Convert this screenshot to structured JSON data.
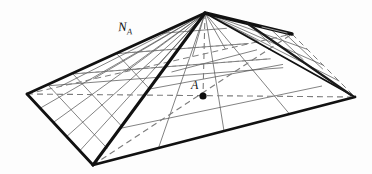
{
  "figure": {
    "kind": "geometric-diagram",
    "background_color": "#fdfdfd",
    "ink_color": "#111111",
    "thin_line_color": "#555555",
    "dashed_line_color": "#7a7a7a"
  },
  "labels": {
    "apex_label": "",
    "face_normal": {
      "base": "N",
      "subscript": "A",
      "text": "N"
    },
    "center_point": {
      "text": "A"
    }
  },
  "geometry": {
    "apex": {
      "x": 205,
      "y": 13
    },
    "base_corners": {
      "left": {
        "x": 27,
        "y": 94
      },
      "front": {
        "x": 93,
        "y": 165
      },
      "right": {
        "x": 355,
        "y": 97
      },
      "back": {
        "x": 292,
        "y": 34
      }
    },
    "center_point_A": {
      "x": 203,
      "y": 96
    },
    "axis": {
      "from": "apex",
      "to": "center_point_A",
      "style": "dashed"
    },
    "diagonals": [
      {
        "from": "left",
        "to": "right",
        "style": "dashed"
      },
      {
        "from": "front",
        "to": "back",
        "style": "dashed"
      }
    ]
  },
  "line_styles": {
    "outline": "solid-thick",
    "ruling": "solid-thin",
    "hidden": "dashed"
  }
}
